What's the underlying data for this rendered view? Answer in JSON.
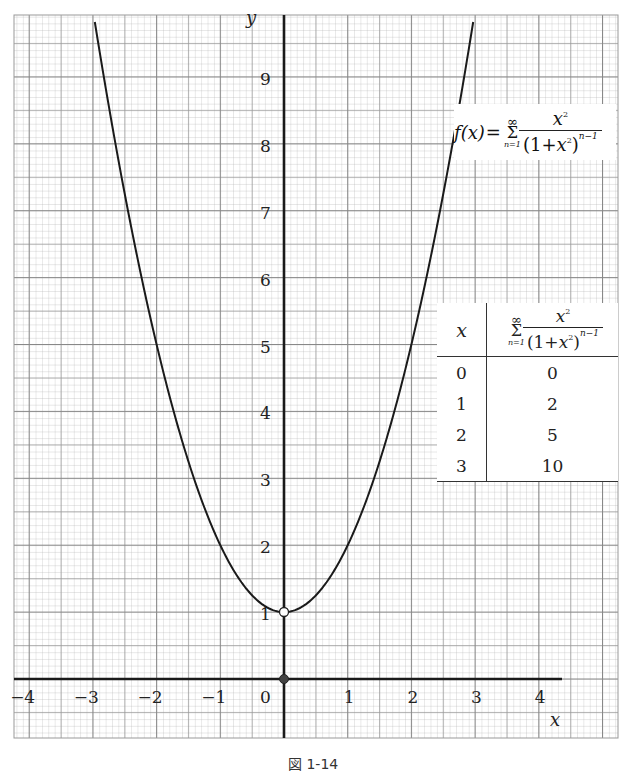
{
  "chart_data": {
    "type": "line",
    "title": "",
    "xlabel": "x",
    "ylabel": "y",
    "xlim": [
      -4.2,
      5.3
    ],
    "ylim": [
      -0.9,
      9.9
    ],
    "grid": true,
    "grid_minor_step": 0.1,
    "grid_major_step": 1,
    "x_ticks": [
      "-4",
      "-3",
      "-2",
      "-1",
      "0",
      "1",
      "2",
      "3",
      "4"
    ],
    "y_ticks": [
      "1",
      "2",
      "3",
      "4",
      "5",
      "6",
      "7",
      "8",
      "9"
    ],
    "series": [
      {
        "name": "f(x)",
        "expression": "f(x) = 1 + x^2 (x ≠ 0), f(0) = 0",
        "x_range": [
          -2.97,
          2.97
        ],
        "sample_points": [
          {
            "x": -3,
            "y": 10
          },
          {
            "x": -2,
            "y": 5
          },
          {
            "x": -1,
            "y": 2
          },
          {
            "x": 0,
            "y": 1
          },
          {
            "x": 1,
            "y": 2
          },
          {
            "x": 2,
            "y": 5
          },
          {
            "x": 3,
            "y": 10
          }
        ]
      }
    ],
    "points": [
      {
        "x": 0,
        "y": 1,
        "style": "open-circle"
      },
      {
        "x": 0,
        "y": 0,
        "style": "filled-dot"
      }
    ],
    "annotations": [
      "f(x) = Σ_{n=1}^{∞} x² / (1+x²)^{n-1}"
    ],
    "table": {
      "headers": [
        "x",
        "Σ_{n=1}^{∞} x²/(1+x²)^{n-1}"
      ],
      "rows": [
        [
          "0",
          "0"
        ],
        [
          "1",
          "2"
        ],
        [
          "2",
          "5"
        ],
        [
          "3",
          "10"
        ]
      ]
    }
  },
  "labels": {
    "x_axis": "x",
    "y_axis": "y",
    "x_ticks": [
      "−4",
      "−3",
      "−2",
      "−1",
      "0",
      "1",
      "2",
      "3",
      "4"
    ],
    "y_ticks": [
      "1",
      "2",
      "3",
      "4",
      "5",
      "6",
      "7",
      "8",
      "9"
    ]
  },
  "formula": {
    "lhs": "f(x)",
    "eq": "=",
    "sum_top": "∞",
    "sum_symbol": "Σ",
    "sum_bottom": "n=1",
    "numerator": "x",
    "num_exp": "2",
    "den_open": "(1+",
    "den_var": "x",
    "den_var_exp": "2",
    "den_close": ")",
    "den_exp": "n−1"
  },
  "table": {
    "col1_header": "x",
    "rows": [
      {
        "x": "0",
        "value": "0"
      },
      {
        "x": "1",
        "value": "2"
      },
      {
        "x": "2",
        "value": "5"
      },
      {
        "x": "3",
        "value": "10"
      }
    ]
  },
  "caption": "図 1-14"
}
